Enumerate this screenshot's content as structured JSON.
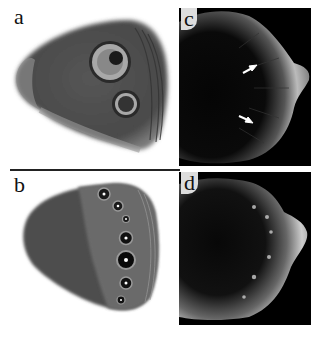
{
  "figure": {
    "panels": [
      {
        "id": "a",
        "label": "a",
        "description": "Butterfly wing (dorsal view) with two eyespots"
      },
      {
        "id": "b",
        "label": "b",
        "description": "Butterfly wing (ventral view) with row of seven small eyespots"
      },
      {
        "id": "c",
        "label": "c",
        "description": "Grayscale micrograph of wing disc with two white arrows"
      },
      {
        "id": "d",
        "label": "d",
        "description": "Grayscale micrograph of wing disc with light spots"
      }
    ],
    "colors": {
      "background": "#ffffff",
      "wing_dark": "#4a4a4a",
      "wing_mid": "#6e6e6e",
      "eyespot_ring": "#b0b0b0",
      "micrograph_bg": "#000000",
      "arrow": "#ffffff"
    }
  }
}
